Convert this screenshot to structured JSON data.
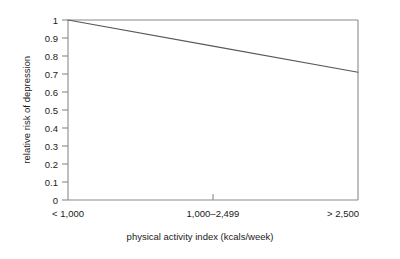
{
  "chart_data": {
    "type": "line",
    "title": "",
    "xlabel": "physical activity index (kcals/week)",
    "ylabel": "relative risk of depression",
    "categories": [
      "< 1,000",
      "1,000–2,499",
      "> 2,500"
    ],
    "x_tick_labels": [
      "< 1,000",
      "1,000–2,499",
      "> 2,500"
    ],
    "y_tick_labels": [
      "1",
      "0.9",
      "0.8",
      "0.7",
      "0.6",
      "0.5",
      "0.4",
      "0.3",
      "0.2",
      "0.1",
      "0"
    ],
    "y_tick_values": [
      1,
      0.9,
      0.8,
      0.7,
      0.6,
      0.5,
      0.4,
      0.3,
      0.2,
      0.1,
      0
    ],
    "ylim": [
      0,
      1
    ],
    "xlim": [
      0,
      2
    ],
    "grid": false,
    "legend": null,
    "series": [
      {
        "name": "relative risk of depression",
        "values": [
          1.0,
          0.855,
          0.71
        ],
        "color": "#595959"
      }
    ],
    "annotations": [],
    "frame": {
      "top": true,
      "right": true,
      "bottom": true,
      "left": true,
      "color": "#888888"
    }
  },
  "colors": {
    "line": "#595959",
    "axis": "#8a8a8a",
    "text": "#1a1a1a",
    "background": "#ffffff"
  }
}
